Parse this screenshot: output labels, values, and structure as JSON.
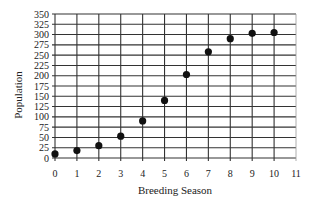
{
  "chart_data": {
    "type": "scatter",
    "title": "",
    "xlabel": "Breeding Season",
    "ylabel": "Population",
    "xlim": [
      0,
      11
    ],
    "ylim": [
      0,
      350
    ],
    "grid": true,
    "legend": null,
    "x_ticks": [
      0,
      1,
      2,
      3,
      4,
      5,
      6,
      7,
      8,
      9,
      10,
      11
    ],
    "y_ticks": [
      0,
      25,
      50,
      75,
      100,
      125,
      150,
      175,
      200,
      225,
      250,
      275,
      300,
      325,
      350
    ],
    "series": [
      {
        "name": "Population",
        "x": [
          0,
          1,
          2,
          3,
          4,
          5,
          6,
          7,
          8,
          9,
          10
        ],
        "y": [
          10,
          18,
          30,
          53,
          90,
          140,
          203,
          258,
          290,
          303,
          305
        ]
      }
    ],
    "colors": {
      "marker": "#111111",
      "grid": "#333333",
      "text": "#222222"
    }
  }
}
